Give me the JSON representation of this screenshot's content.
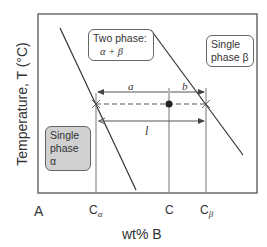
{
  "figure": {
    "type": "binary phase diagram (lever rule)",
    "y_axis_label": "Temperature, T  (°C)",
    "x_axis_label": "wt% B",
    "x_left_label": "A",
    "composition_ticks": [
      {
        "name": "C",
        "sub": "α",
        "x": 96
      },
      {
        "name": "C",
        "sub": "",
        "x": 169
      },
      {
        "name": "C",
        "sub": "β",
        "x": 206
      }
    ],
    "regions": {
      "two_phase": {
        "line1": "Two phase:",
        "line2": "α + β"
      },
      "single_beta": {
        "line1": "Single",
        "line2": "phase β"
      },
      "single_alpha": {
        "line1": "Single",
        "line2": "phase α"
      }
    },
    "lever_labels": {
      "a": "a",
      "b": "b",
      "l": "l"
    },
    "colors": {
      "line": "#3a3a3a",
      "frame": "#555555",
      "shaded_box": "#d0d0d0"
    }
  }
}
